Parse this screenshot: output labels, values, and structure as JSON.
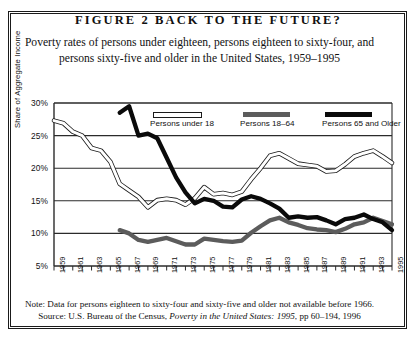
{
  "figure": {
    "title": "FIGURE 2    BACK TO THE FUTURE?",
    "subtitle": "Poverty rates of persons under eighteen, persons eighteen to sixty-four, and persons sixty-five and older in the United States, 1959–1995",
    "note": "Note: Data for persons eighteen to sixty-four and sixty-five and older not available before 1966.",
    "source_prefix": "Source: U.S. Bureau of the Census, ",
    "source_italic": "Poverty in the United States: 1995",
    "source_suffix": ", pp 60–194, 1996"
  },
  "chart_data": {
    "type": "line",
    "title": "FIGURE 2    BACK TO THE FUTURE?",
    "subtitle": "Poverty rates of persons under eighteen, persons eighteen to sixty-four, and persons sixty-five and older in the United States, 1959–1995",
    "xlabel": "",
    "ylabel": "Share of Aggregate Income",
    "ylim": [
      5,
      30
    ],
    "ytick_labels": [
      "30%",
      "25%",
      "20%",
      "15%",
      "10%",
      "5%"
    ],
    "ytick_values": [
      30,
      25,
      20,
      15,
      10,
      5
    ],
    "grid": true,
    "grid_axis": "y",
    "xlim": [
      1959,
      1995
    ],
    "x": [
      1959,
      1960,
      1961,
      1962,
      1963,
      1964,
      1965,
      1966,
      1967,
      1968,
      1969,
      1970,
      1971,
      1972,
      1973,
      1974,
      1975,
      1976,
      1977,
      1978,
      1979,
      1980,
      1981,
      1982,
      1983,
      1984,
      1985,
      1986,
      1987,
      1988,
      1989,
      1990,
      1991,
      1992,
      1993,
      1994,
      1995
    ],
    "xtick_labels": [
      "1959",
      "1961",
      "1963",
      "1965",
      "1967",
      "1969",
      "1971",
      "1973",
      "1975",
      "1977",
      "1979",
      "1981",
      "1983",
      "1985",
      "1987",
      "1989",
      "1991",
      "1993",
      "1995"
    ],
    "legend_position": "top-inside",
    "series": [
      {
        "name": "Persons under 18",
        "style": "white-outline",
        "values": [
          27.3,
          26.9,
          25.6,
          25.0,
          23.1,
          22.7,
          21.0,
          17.6,
          16.6,
          15.6,
          14.0,
          15.1,
          15.3,
          15.1,
          14.4,
          15.4,
          17.1,
          16.0,
          16.2,
          15.9,
          16.4,
          18.3,
          20.0,
          21.9,
          22.3,
          21.5,
          20.7,
          20.5,
          20.3,
          19.5,
          19.6,
          20.6,
          21.8,
          22.3,
          22.7,
          21.8,
          20.8
        ]
      },
      {
        "name": "Persons 18–64",
        "style": "gray",
        "values": [
          null,
          null,
          null,
          null,
          null,
          null,
          null,
          10.5,
          10.0,
          9.0,
          8.7,
          9.0,
          9.3,
          8.8,
          8.3,
          8.3,
          9.2,
          9.0,
          8.8,
          8.7,
          8.9,
          10.1,
          11.1,
          12.0,
          12.4,
          11.7,
          11.3,
          10.8,
          10.6,
          10.5,
          10.2,
          10.7,
          11.4,
          11.7,
          12.4,
          11.9,
          11.4
        ]
      },
      {
        "name": "Persons 65 and Older",
        "style": "black",
        "values": [
          null,
          null,
          null,
          null,
          null,
          null,
          null,
          28.5,
          29.5,
          25.0,
          25.3,
          24.6,
          21.6,
          18.6,
          16.3,
          14.6,
          15.3,
          15.0,
          14.1,
          14.0,
          15.2,
          15.7,
          15.3,
          14.6,
          13.8,
          12.4,
          12.6,
          12.4,
          12.5,
          12.0,
          11.4,
          12.2,
          12.4,
          12.9,
          12.2,
          11.7,
          10.5
        ]
      }
    ]
  }
}
